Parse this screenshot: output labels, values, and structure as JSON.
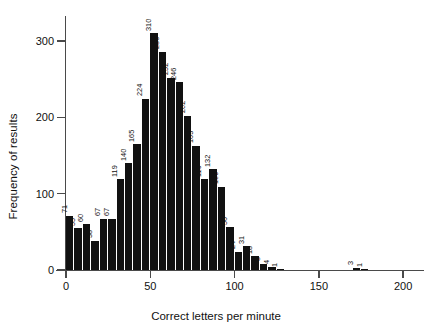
{
  "chart_data": {
    "type": "bar",
    "title": "",
    "subtitle": "",
    "xlabel": "Correct letters per minute",
    "ylabel": "Frequency of results",
    "xlim": [
      0,
      210
    ],
    "ylim": [
      0,
      330
    ],
    "xticks": [
      0,
      50,
      100,
      150,
      200
    ],
    "yticks": [
      0,
      100,
      200,
      300
    ],
    "grid": false,
    "legend": null,
    "bin_width": 5,
    "bin_starts": [
      0,
      5,
      10,
      15,
      20,
      25,
      30,
      35,
      40,
      45,
      50,
      55,
      60,
      65,
      70,
      75,
      80,
      85,
      90,
      95,
      100,
      105,
      110,
      115,
      120,
      125,
      130,
      135,
      140,
      170,
      175
    ],
    "categories": [
      "0-5",
      "5-10",
      "10-15",
      "15-20",
      "20-25",
      "25-30",
      "30-35",
      "35-40",
      "40-45",
      "45-50",
      "50-55",
      "55-60",
      "60-65",
      "65-70",
      "70-75",
      "75-80",
      "80-85",
      "85-90",
      "90-95",
      "95-100",
      "100-105",
      "105-110",
      "110-115",
      "115-120",
      "120-125",
      "125-130",
      "130-135",
      "135-140",
      "140-145",
      "170-175",
      "175-180"
    ],
    "values": [
      71,
      55,
      60,
      38,
      67,
      67,
      119,
      140,
      165,
      224,
      310,
      286,
      252,
      246,
      202,
      163,
      119,
      132,
      109,
      56,
      24,
      31,
      18,
      8,
      4,
      1,
      0,
      0,
      0,
      3,
      1
    ],
    "bar_labels": [
      "71",
      "55",
      "60",
      "38",
      "67",
      "67",
      "119",
      "140",
      "165",
      "224",
      "310",
      "286",
      "252",
      "246",
      "202",
      "163",
      "119",
      "132",
      "109",
      "56",
      "24",
      "31",
      "18",
      "8",
      "4",
      "1",
      "",
      "",
      "",
      "3",
      "1"
    ],
    "colors": {
      "bar": "#111111",
      "axis": "#4a4a4a",
      "text": "#111111",
      "background": "#ffffff"
    }
  }
}
